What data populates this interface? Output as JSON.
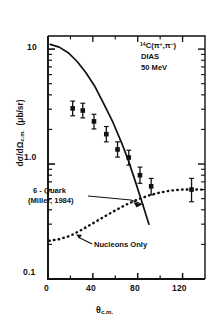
{
  "chart_data": {
    "type": "scatter",
    "title": "",
    "xlabel": "θ c.m.",
    "ylabel": "dσ/dΩ c.m.  (μb/sr)",
    "xlim": [
      0,
      140
    ],
    "ylim": [
      0.1,
      13
    ],
    "yscale": "log",
    "grid": false,
    "xticks": [
      0,
      40,
      80,
      120
    ],
    "xticklabels": [
      "0",
      "40",
      "80",
      "120"
    ],
    "xminorticks": [
      20,
      60,
      100
    ],
    "yticklabels": [
      "10",
      "1.0",
      "0.1"
    ],
    "ytickvalues": [
      10,
      1.0,
      0.1
    ],
    "series": [
      {
        "name": "data",
        "type": "scatter",
        "marker": "filled-square",
        "points": [
          {
            "x": 22,
            "y": 3.05,
            "yerr_low": 0.42,
            "yerr_high": 0.48
          },
          {
            "x": 31,
            "y": 2.92,
            "yerr_low": 0.4,
            "yerr_high": 0.46
          },
          {
            "x": 41,
            "y": 2.35,
            "yerr_low": 0.33,
            "yerr_high": 0.36
          },
          {
            "x": 52,
            "y": 1.82,
            "yerr_low": 0.26,
            "yerr_high": 0.3
          },
          {
            "x": 62,
            "y": 1.34,
            "yerr_low": 0.19,
            "yerr_high": 0.22
          },
          {
            "x": 72,
            "y": 1.14,
            "yerr_low": 0.16,
            "yerr_high": 0.18
          },
          {
            "x": 82,
            "y": 0.8,
            "yerr_low": 0.12,
            "yerr_high": 0.14
          },
          {
            "x": 92,
            "y": 0.64,
            "yerr_low": 0.1,
            "yerr_high": 0.11
          },
          {
            "x": 128,
            "y": 0.6,
            "yerr_low": 0.13,
            "yerr_high": 0.15
          }
        ]
      },
      {
        "name": "6-Quark (Miller, 1984)",
        "type": "line",
        "linestyle": "solid",
        "points": [
          {
            "x": 2,
            "y": 11.0
          },
          {
            "x": 10,
            "y": 10.4
          },
          {
            "x": 18,
            "y": 9.3
          },
          {
            "x": 26,
            "y": 7.8
          },
          {
            "x": 34,
            "y": 6.2
          },
          {
            "x": 42,
            "y": 4.7
          },
          {
            "x": 50,
            "y": 3.3
          },
          {
            "x": 58,
            "y": 2.3
          },
          {
            "x": 66,
            "y": 1.5
          },
          {
            "x": 72,
            "y": 1.05
          },
          {
            "x": 78,
            "y": 0.7
          },
          {
            "x": 84,
            "y": 0.46
          },
          {
            "x": 90,
            "y": 0.3
          }
        ]
      },
      {
        "name": "Nucleons Only",
        "type": "line",
        "linestyle": "dotted",
        "points": [
          {
            "x": 1,
            "y": 0.215
          },
          {
            "x": 10,
            "y": 0.222
          },
          {
            "x": 20,
            "y": 0.238
          },
          {
            "x": 30,
            "y": 0.268
          },
          {
            "x": 40,
            "y": 0.305
          },
          {
            "x": 50,
            "y": 0.348
          },
          {
            "x": 60,
            "y": 0.395
          },
          {
            "x": 70,
            "y": 0.445
          },
          {
            "x": 80,
            "y": 0.492
          },
          {
            "x": 90,
            "y": 0.534
          },
          {
            "x": 100,
            "y": 0.566
          },
          {
            "x": 110,
            "y": 0.589
          },
          {
            "x": 120,
            "y": 0.6
          },
          {
            "x": 130,
            "y": 0.602
          },
          {
            "x": 139,
            "y": 0.598
          }
        ]
      }
    ],
    "annotations": [
      {
        "name": "reaction",
        "text": "¹⁴C(π⁺,π⁻)"
      },
      {
        "name": "dias",
        "text": "DIAS"
      },
      {
        "name": "energy",
        "text": "50 MeV"
      },
      {
        "name": "six-quark-line1",
        "text": "6 - Quark"
      },
      {
        "name": "six-quark-line2",
        "text": "(Miller, 1984)"
      },
      {
        "name": "nucleons-only",
        "text": "Nucleons Only"
      }
    ]
  },
  "labels": {
    "reaction_pre": "14",
    "reaction_main": "C(π",
    "reaction_sup1": "+",
    "reaction_mid": ",π",
    "reaction_sup2": "−",
    "reaction_end": ")",
    "dias": "DIAS",
    "energy": "50 MeV",
    "six_quark_l1": "6 - Quark",
    "six_quark_l2": "(Miller, 1984)",
    "nucleons_only": "Nucleons Only",
    "y_top": "10",
    "y_mid": "1.0",
    "y_bot": "0.1",
    "x0": "0",
    "x40": "40",
    "x80": "80",
    "x120": "120",
    "xaxis_sym": "θ",
    "xaxis_sub": "c.m.",
    "yaxis_num": "dσ",
    "yaxis_den": "dΩ",
    "yaxis_sub": "c.m.",
    "yaxis_unit": "(μb/sr)"
  },
  "style": {
    "ink": "#111111",
    "background": "#ffffff"
  }
}
